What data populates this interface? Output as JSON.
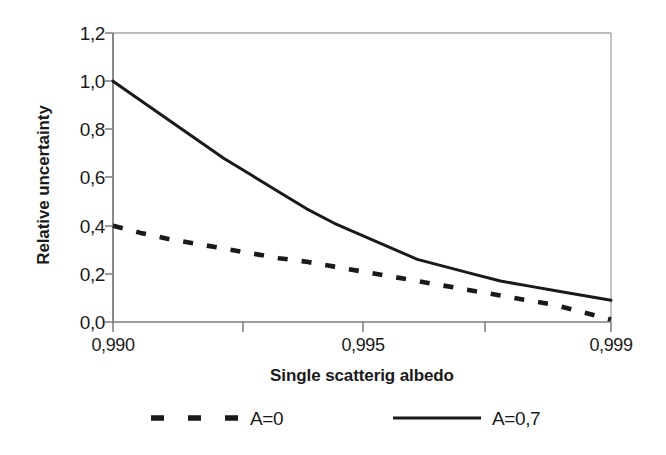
{
  "chart_data": {
    "type": "line",
    "title": "",
    "xlabel": "Single scatterig albedo",
    "ylabel": "Relative uncertainty",
    "xlim": [
      0.99,
      0.999
    ],
    "ylim": [
      0.0,
      1.2
    ],
    "grid": false,
    "legend_position": "below-axis",
    "decimal_separator": ",",
    "x_tick_labels": [
      "0,990",
      "0,995",
      "0,999"
    ],
    "y_tick_labels": [
      "0,0",
      "0,2",
      "0,4",
      "0,6",
      "0,8",
      "1,0",
      "1,2"
    ],
    "y_tick_values": [
      0.0,
      0.2,
      0.4,
      0.6,
      0.8,
      1.0,
      1.2
    ],
    "x": [
      0.99,
      0.9905,
      0.991,
      0.9915,
      0.992,
      0.9925,
      0.993,
      0.9935,
      0.994,
      0.9945,
      0.995,
      0.9955,
      0.996,
      0.9965,
      0.997,
      0.9975,
      0.998,
      0.9985,
      0.999
    ],
    "series": [
      {
        "name": "A=0,7",
        "style": "solid",
        "color": "#1a1a1a",
        "values": [
          1.0,
          0.92,
          0.84,
          0.76,
          0.68,
          0.61,
          0.54,
          0.47,
          0.41,
          0.36,
          0.31,
          0.26,
          0.23,
          0.2,
          0.17,
          0.15,
          0.13,
          0.11,
          0.09
        ]
      },
      {
        "name": "A=0",
        "style": "dashed",
        "color": "#1a1a1a",
        "values": [
          0.4,
          0.37,
          0.345,
          0.325,
          0.305,
          0.285,
          0.265,
          0.25,
          0.23,
          0.21,
          0.19,
          0.17,
          0.15,
          0.13,
          0.11,
          0.09,
          0.07,
          0.04,
          0.01
        ]
      }
    ],
    "colors": {
      "ink": "#1a1a1a",
      "frame": "#a8a8a8",
      "axis": "#7d7d7d",
      "background": "#ffffff"
    }
  },
  "axes": {
    "y_title": "Relative uncertainty",
    "x_title": "Single scatterig albedo",
    "y_ticks": [
      {
        "label": "1,2"
      },
      {
        "label": "1,0"
      },
      {
        "label": "0,8"
      },
      {
        "label": "0,6"
      },
      {
        "label": "0,4"
      },
      {
        "label": "0,2"
      },
      {
        "label": "0,0"
      }
    ],
    "x_ticks": [
      {
        "label": "0,990"
      },
      {
        "label": "0,995"
      },
      {
        "label": "0,999"
      }
    ]
  },
  "legend": {
    "entries": [
      {
        "label": "A=0",
        "style": "dashed"
      },
      {
        "label": "A=0,7",
        "style": "solid"
      }
    ]
  }
}
